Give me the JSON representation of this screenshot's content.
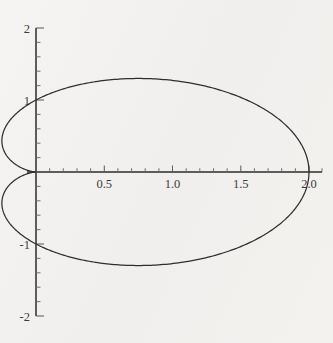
{
  "chart_data": {
    "type": "line",
    "title": "",
    "subtitle": "",
    "xlabel": "",
    "ylabel": "",
    "curve_name": "cardioid",
    "equation": "r = 1 + cos(theta)",
    "closed": true,
    "grid": false,
    "legend": "none",
    "xlim": [
      -0.27,
      2.18
    ],
    "ylim": [
      -2,
      2
    ],
    "x_ticks_major": [
      0.5,
      1.0,
      1.5,
      2.0
    ],
    "x_tick_labels": [
      "0.5",
      "1.0",
      "1.5",
      "2.0"
    ],
    "x_ticks_minor": [
      0.1,
      0.2,
      0.3,
      0.4,
      0.6,
      0.7,
      0.8,
      0.9,
      1.1,
      1.2,
      1.3,
      1.4,
      1.6,
      1.7,
      1.8,
      1.9,
      2.1
    ],
    "y_ticks_major": [
      2,
      1,
      -1,
      -2
    ],
    "y_tick_labels": [
      "2",
      "1",
      "-1",
      "-2"
    ],
    "y_ticks_minor": [
      1.8,
      1.6,
      1.4,
      1.2,
      0.8,
      0.6,
      0.4,
      0.2,
      -0.2,
      -0.4,
      -0.6,
      -0.8,
      -1.2,
      -1.4,
      -1.6,
      -1.8
    ],
    "annotations": [],
    "features": {
      "cusp_point": [
        0,
        0
      ],
      "rightmost_point": [
        2,
        0
      ],
      "max_y": 1.299,
      "max_y_at_x": 1.5,
      "min_y": -1.299,
      "min_y_at_x": 1.5
    },
    "points": [
      [
        2.0,
        0.0
      ],
      [
        1.995,
        0.0524
      ],
      [
        1.98,
        0.1044
      ],
      [
        1.9553,
        0.1554
      ],
      [
        1.9208,
        0.2052
      ],
      [
        1.8767,
        0.2532
      ],
      [
        1.8232,
        0.299
      ],
      [
        1.7608,
        0.3423
      ],
      [
        1.6898,
        0.3827
      ],
      [
        1.6108,
        0.4199
      ],
      [
        1.5243,
        0.4534
      ],
      [
        1.4309,
        0.4831
      ],
      [
        1.3315,
        0.5086
      ],
      [
        1.2267,
        0.5298
      ],
      [
        1.1173,
        0.5464
      ],
      [
        1.0043,
        0.5584
      ],
      [
        0.8884,
        0.5656
      ],
      [
        0.7707,
        0.5681
      ],
      [
        0.6522,
        0.5657
      ],
      [
        0.5337,
        0.5587
      ],
      [
        0.4162,
        0.5471
      ],
      [
        0.3007,
        0.5311
      ],
      [
        0.1883,
        0.5109
      ],
      [
        0.0797,
        0.4867
      ],
      [
        0.024,
        0.4619
      ],
      [
        0.0,
        0.0
      ]
    ],
    "parametric_points_upper": [
      [
        0.0,
        0.0
      ],
      [
        0.0337,
        0.1877
      ],
      [
        0.1314,
        0.3744
      ],
      [
        0.2865,
        0.5519
      ],
      [
        0.4909,
        0.7124
      ],
      [
        0.7353,
        0.8491
      ],
      [
        1.0095,
        0.9566
      ],
      [
        1.3027,
        1.0311
      ],
      [
        1.5,
        1.299
      ],
      [
        1.7,
        1.18
      ],
      [
        1.8856,
        0.8856
      ],
      [
        1.9934,
        0.5
      ],
      [
        2.0,
        0.0
      ]
    ]
  },
  "axes": {
    "origin_px": [
      36,
      172
    ],
    "x_unit_px": 136.5,
    "y_unit_px": 72,
    "axis_color": "#5a5a5a",
    "curve_color": "#2e2e2e",
    "background_color": "#f3f1ef",
    "text_color": "#3b3b3b"
  }
}
